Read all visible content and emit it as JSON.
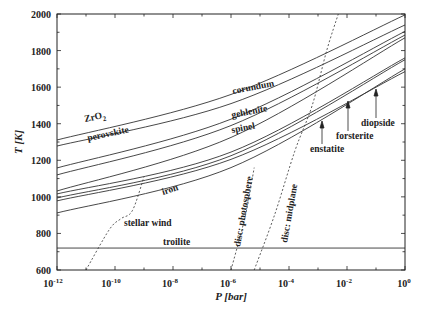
{
  "chart_data": {
    "type": "line",
    "title": "",
    "xlabel": "P [bar]",
    "ylabel": "T [K]",
    "xscale": "log",
    "xlim": [
      1e-12,
      1
    ],
    "ylim": [
      600,
      2000
    ],
    "grid": false,
    "x_ticks": [
      "10^-12",
      "10^-10",
      "10^-8",
      "10^-6",
      "10^-4",
      "10^-2",
      "10^0"
    ],
    "x_tick_exponents": [
      -12,
      -10,
      -8,
      -6,
      -4,
      -2,
      0
    ],
    "y_ticks": [
      600,
      800,
      1000,
      1200,
      1400,
      1600,
      1800,
      2000
    ],
    "series": [
      {
        "name": "ZrO2",
        "style": "solid",
        "log_p": [
          -12,
          -6,
          0
        ],
        "T": [
          1311,
          1560,
          1995
        ]
      },
      {
        "name": "corundum",
        "style": "solid",
        "log_p": [
          -12,
          -6,
          0
        ],
        "T": [
          1278,
          1510,
          1940
        ]
      },
      {
        "name": "perovskite",
        "style": "solid",
        "log_p": [
          -12,
          -6,
          0
        ],
        "T": [
          1158,
          1425,
          1905
        ]
      },
      {
        "name": "gehlenite",
        "style": "solid",
        "log_p": [
          -12,
          -6,
          0
        ],
        "T": [
          1120,
          1390,
          1885
        ]
      },
      {
        "name": "spinel",
        "style": "solid",
        "log_p": [
          -12,
          -6,
          0
        ],
        "T": [
          1032,
          1325,
          1870
        ]
      },
      {
        "name": "diopside",
        "style": "solid",
        "log_p": [
          -12,
          -6,
          0
        ],
        "T": [
          1016,
          1245,
          1760
        ]
      },
      {
        "name": "forsterite",
        "style": "solid",
        "log_p": [
          -12,
          -6,
          0
        ],
        "T": [
          994,
          1225,
          1750
        ]
      },
      {
        "name": "enstatite",
        "style": "solid",
        "log_p": [
          -12,
          -6,
          0
        ],
        "T": [
          978,
          1205,
          1685
        ]
      },
      {
        "name": "iron",
        "style": "solid",
        "log_p": [
          -12,
          -6,
          0
        ],
        "T": [
          912,
          1160,
          1700
        ]
      },
      {
        "name": "troilite",
        "style": "solid",
        "log_p": [
          -12,
          0
        ],
        "T": [
          720,
          720
        ]
      },
      {
        "name": "stellar wind",
        "style": "dashed",
        "log_p": [
          -11.0,
          -10.2,
          -9.8,
          -9.4,
          -9.0
        ],
        "T": [
          600,
          820,
          880,
          925,
          1110
        ]
      },
      {
        "name": "disc: photosphere",
        "style": "dashed",
        "log_p": [
          -6.0,
          -5.5,
          -5.2
        ],
        "T": [
          600,
          900,
          1160
        ]
      },
      {
        "name": "disc: midplane",
        "style": "dashed",
        "log_p": [
          -5.2,
          -4.5,
          -3.8,
          -3.2,
          -2.7,
          -2.3
        ],
        "T": [
          600,
          900,
          1250,
          1500,
          1800,
          2000
        ]
      }
    ],
    "annotations": [
      {
        "text": "ZrO2",
        "log_p": -10.2,
        "T": 1370,
        "rotate": -12
      },
      {
        "text": "corundum",
        "log_p": -6.6,
        "T": 1490,
        "rotate": -11
      },
      {
        "text": "perovskite",
        "log_p": -9.7,
        "T": 1295,
        "rotate": -12
      },
      {
        "text": "gehlenite",
        "log_p": -6.6,
        "T": 1405,
        "rotate": -11
      },
      {
        "text": "spinel",
        "log_p": -6.6,
        "T": 1335,
        "rotate": -11
      },
      {
        "text": "iron",
        "log_p": -8.6,
        "T": 1050,
        "rotate": -18
      },
      {
        "text": "stellar wind",
        "log_p": -9.2,
        "T": 870,
        "rotate": 0
      },
      {
        "text": "troilite",
        "log_p": -8.4,
        "T": 735,
        "rotate": 0
      },
      {
        "text": "disc: photosphere",
        "log_p": -6.2,
        "T": 930,
        "rotate": -80
      },
      {
        "text": "disc: midplane",
        "log_p": -4.5,
        "T": 950,
        "rotate": -80
      },
      {
        "text": "enstatite",
        "log_p": -2.6,
        "T": 1315,
        "rotate": 0,
        "arrow_to_log_p": -2.2,
        "arrow_to_T": 1445
      },
      {
        "text": "forsterite",
        "log_p": -1.6,
        "T": 1360,
        "rotate": 0,
        "arrow_to_log_p": -1.3,
        "arrow_to_T": 1590
      },
      {
        "text": "diopside",
        "log_p": -0.95,
        "T": 1435,
        "rotate": 0,
        "arrow_to_log_p": -0.6,
        "arrow_to_T": 1640
      }
    ]
  },
  "labels": {
    "x_axis_title": "P [bar]",
    "y_axis_title": "T [K]",
    "x_tick_labels": [
      "10",
      "10",
      "10",
      "10",
      "10",
      "10",
      "10"
    ],
    "x_tick_exps": [
      "-12",
      "-10",
      "-8",
      "-6",
      "-4",
      "-2",
      "0"
    ],
    "y_tick_labels": [
      "600",
      "800",
      "1000",
      "1200",
      "1400",
      "1600",
      "1800",
      "2000"
    ],
    "curve_labels": {
      "zro2": "ZrO",
      "zro2_sub": "2",
      "corundum": "corundum",
      "perovskite": "perovskite",
      "gehlenite": "gehlenite",
      "spinel": "spinel",
      "iron": "iron",
      "stellar_wind": "stellar wind",
      "troilite": "troilite",
      "disc_photosphere": "disc: photosphere",
      "disc_midplane": "disc: midplane",
      "enstatite": "enstatite",
      "forsterite": "forsterite",
      "diopside": "diopside"
    }
  },
  "colors": {
    "line": "#333333",
    "axis": "#222222",
    "background": "#ffffff"
  }
}
